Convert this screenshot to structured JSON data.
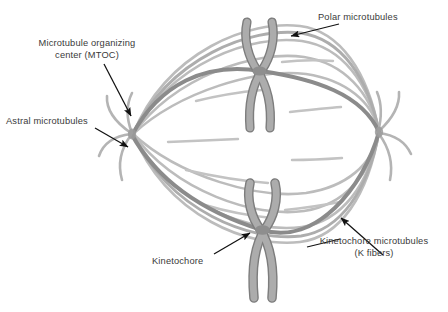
{
  "figure": {
    "background_color": "#ffffff"
  },
  "labels": {
    "mtoc_line1": "Microtubule organizing",
    "mtoc_line2": "center (MTOC)",
    "astral": "Astral microtubules",
    "polar": "Polar microtubules",
    "kinetochore": "Kinetochore",
    "kfibers_line1": "Kinetochore microtubules",
    "kfibers_line2": "(K fibers)"
  },
  "colors": {
    "text": "#3a3a3a",
    "arrow": "#111111",
    "microtubule_light": "#b9b9b9",
    "microtubule_mid": "#a6a6a6",
    "kfiber_dark": "#8b8b8b",
    "chromosome_fill": "#a9a9a9",
    "chromosome_stroke": "#7d7d7d",
    "centromere": "#8a8a8a"
  },
  "structures": {
    "pole_left": "microtubule-organizing-center-left",
    "pole_right": "microtubule-organizing-center-right",
    "chromosome_upper": "chromosome-upper",
    "chromosome_lower": "chromosome-lower",
    "spindle": "spindle-apparatus"
  }
}
